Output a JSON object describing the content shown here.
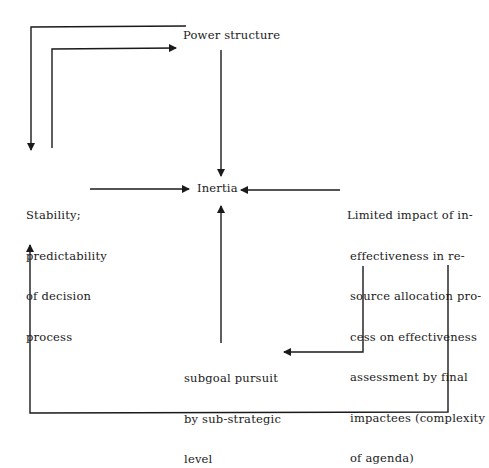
{
  "diagram": {
    "nodes": {
      "power_structure": "Power structure",
      "inertia": "Inertia",
      "stability": [
        "Stability;",
        "predictability",
        "of decision",
        "process"
      ],
      "limited_impact": [
        "Limited impact of in-",
        "effectiveness in re-",
        "source allocation pro-",
        "cess on effectiveness",
        "assessment by final",
        "impactees (complexity",
        "of agenda)"
      ],
      "subgoal": [
        "subgoal pursuit",
        "by sub-strategic",
        "level"
      ]
    },
    "edges": [
      {
        "from": "Stability",
        "to": "Power structure"
      },
      {
        "from": "Power structure",
        "to": "Stability"
      },
      {
        "from": "Power structure",
        "to": "Inertia"
      },
      {
        "from": "Stability",
        "to": "Inertia"
      },
      {
        "from": "Limited impact",
        "to": "Inertia"
      },
      {
        "from": "Subgoal pursuit",
        "to": "Inertia"
      },
      {
        "from": "Limited impact",
        "to": "Subgoal pursuit"
      },
      {
        "from": "Limited impact",
        "to": "Stability"
      }
    ],
    "colors": {
      "line": "#1a1a1a",
      "background": "#ffffff"
    }
  }
}
